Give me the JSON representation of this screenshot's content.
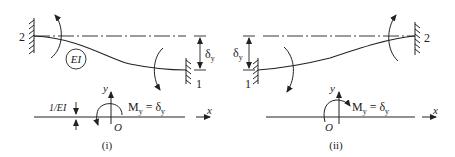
{
  "figure": {
    "panels": [
      {
        "id": "i",
        "caption": "(i)",
        "support_left_label": "2",
        "support_right_label": "1",
        "beam_label": "EI",
        "deflection_label": "δ",
        "deflection_sub": "y",
        "axis_x_label": "x",
        "axis_y_label": "y",
        "origin_label": "O",
        "moment_label_main": "M",
        "moment_label_sub": "y",
        "moment_label_eq": " = δ",
        "moment_label_eq_sub": "y",
        "load_label": "1/EI"
      },
      {
        "id": "ii",
        "caption": "(ii)",
        "support_left_label": "1",
        "support_right_label": "2",
        "deflection_label": "δ",
        "deflection_sub": "y",
        "axis_x_label": "x",
        "axis_y_label": "y",
        "origin_label": "O",
        "moment_label_main": "M",
        "moment_label_sub": "y",
        "moment_label_eq": " = δ",
        "moment_label_eq_sub": "y"
      }
    ],
    "colors": {
      "ink": "#222222",
      "background": "#ffffff"
    }
  }
}
